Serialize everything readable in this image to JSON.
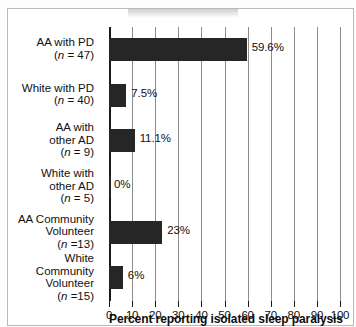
{
  "chart_data": {
    "type": "bar",
    "orientation": "horizontal",
    "title": "",
    "xlabel": "Percent reporting isolated sleep paralysis",
    "ylabel": "",
    "xlim": [
      0,
      100
    ],
    "xticks": [
      0,
      10,
      20,
      30,
      40,
      50,
      60,
      70,
      80,
      90,
      100
    ],
    "xtick_labels": [
      "0",
      "10",
      "20",
      "30",
      "40",
      "50",
      "60",
      "70",
      "80",
      "90",
      "100"
    ],
    "grid": true,
    "legend": "none",
    "bar_color": "#262626",
    "categories": [
      "AA with PD (n = 47)",
      "White with PD (n = 40)",
      "AA with other AD (n = 9)",
      "White with other AD (n = 5)",
      "AA Community Volunteer (n =13)",
      "White Community Volunteer (n =15)"
    ],
    "values": [
      59.6,
      7.5,
      11.1,
      0,
      23,
      6
    ],
    "data_labels": [
      "59.6%",
      "7.5%",
      "11.1%",
      "0%",
      "23%",
      "6%"
    ],
    "bars": [
      {
        "group": "AA with PD",
        "line1": "AA with PD",
        "line2": "",
        "n_prefix": "(",
        "n_italic": "n",
        "n_suffix": " = 47)",
        "value": 59.6,
        "label": "59.6%"
      },
      {
        "group": "White with PD",
        "line1": "White with PD",
        "line2": "",
        "n_prefix": "(",
        "n_italic": "n",
        "n_suffix": " = 40)",
        "value": 7.5,
        "label": "7.5%"
      },
      {
        "group": "AA with other AD",
        "line1": "AA with",
        "line2": "other AD",
        "n_prefix": "(",
        "n_italic": "n",
        "n_suffix": " = 9)",
        "value": 11.1,
        "label": "11.1%"
      },
      {
        "group": "White with other AD",
        "line1": "White with",
        "line2": "other AD",
        "n_prefix": "(",
        "n_italic": "n",
        "n_suffix": " = 5)",
        "value": 0,
        "label": "0%"
      },
      {
        "group": "AA Community Volunteer",
        "line1": "AA Community",
        "line2": "Volunteer",
        "n_prefix": "(",
        "n_italic": "n",
        "n_suffix": " =13)",
        "value": 23,
        "label": "23%"
      },
      {
        "group": "White Community Volunteer",
        "line1": "White",
        "line2": "Community",
        "line3": "Volunteer",
        "n_prefix": "(",
        "n_italic": "n",
        "n_suffix": " =15)",
        "value": 6,
        "label": "6%"
      }
    ]
  }
}
